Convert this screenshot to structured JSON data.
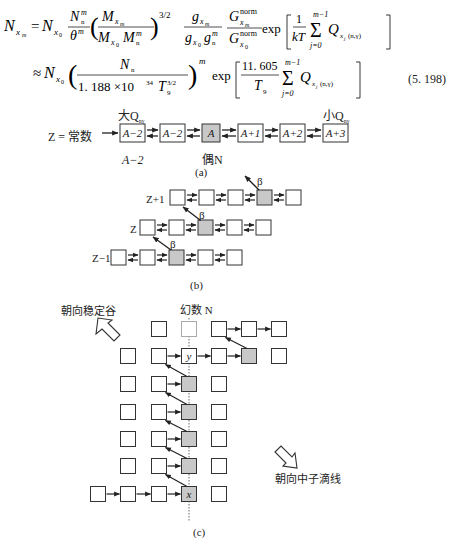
{
  "equation": {
    "line1": {
      "lhs": "N",
      "lhs_sub": "x",
      "lhs_subsub": "m",
      "rhs": "= N_{x_0} (N_n^m / θ^m) (M_{x_m} / (M_{x_0} M_n^m))^{3/2} (g_{x_m} / (g_{x_0} g_n^m)) (G_{x_m}^norm / G_{x_0}^norm) exp [ (1/kT) Σ_{j=0}^{m-1} Q_{x_j(n,γ)} ]"
    },
    "line2": {
      "rhs": "≈ N_{x_0} ( N_n / (1.188×10^34 T_9^{3/2}) )^m exp [ (11.605 / T_9) Σ_{j=0}^{m-1} Q_{x_j(n,γ)} ]"
    },
    "number": "(5. 198)",
    "parts": {
      "exp": "exp",
      "norm": "norm",
      "three_halves": "3/2",
      "m": "m",
      "one": "1",
      "kT": "kT",
      "j0": "j=0",
      "m1": "m−1",
      "Q": "Q",
      "ng": "(n,γ)",
      "const": "1. 188 ×10",
      "pow34": "34",
      "T": "T",
      "nine": "9",
      "c11": "11. 605",
      "approx": "≈"
    }
  },
  "figure_a": {
    "left_label": "Z = 常数",
    "boxes": [
      "A−2",
      "A−2",
      "A",
      "A+1",
      "A+2",
      "A+3"
    ],
    "highlight_index": 2,
    "top_left": "大Q",
    "top_left_sub": "nγ",
    "top_right": "小Q",
    "top_right_sub": "nγ",
    "below_left": "A−2",
    "below_mid": "偶N",
    "caption": "(a)"
  },
  "figure_b": {
    "rows": [
      {
        "label": "Z+1",
        "boxes": 5,
        "highlight": 3
      },
      {
        "label": "Z",
        "boxes": 5,
        "highlight": 2
      },
      {
        "label": "Z−1",
        "boxes": 5,
        "highlight": 2
      }
    ],
    "beta": "β",
    "caption": "(b)"
  },
  "figure_c": {
    "stable_label": "朝向稳定谷",
    "drip_label": "朝向中子滴线",
    "magic_label": "幻数 N",
    "y_label": "y",
    "x_label": "x",
    "caption": "(c)"
  },
  "colors": {
    "box_fill": "#ffffff",
    "box_highlight": "#c8c8c8",
    "stroke": "#333333"
  }
}
